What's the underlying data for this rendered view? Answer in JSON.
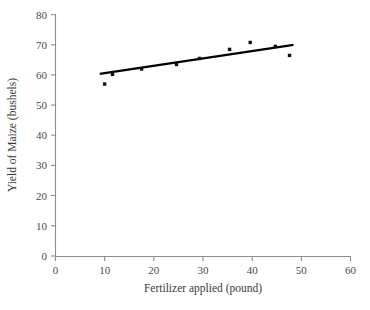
{
  "chart_data": {
    "type": "scatter",
    "title": "",
    "subtitle": "",
    "xlabel": "Fertilizer applied (pound)",
    "ylabel": "Yield of Maize (bushels)",
    "xlim": [
      0,
      60
    ],
    "ylim": [
      0,
      80
    ],
    "xticks": [
      0,
      10,
      20,
      30,
      40,
      50,
      60
    ],
    "yticks": [
      0,
      10,
      20,
      30,
      40,
      50,
      60,
      70,
      80
    ],
    "xtick_labels": [
      "0",
      "10",
      "20",
      "30",
      "40",
      "50",
      "60"
    ],
    "ytick_labels": [
      "0",
      "10",
      "20",
      "30",
      "40",
      "50",
      "60",
      "70",
      "80"
    ],
    "grid": false,
    "legend": null,
    "legend_position": "none",
    "marker": "square",
    "marker_color": "#111111",
    "series": [
      {
        "name": "Observed yield",
        "type": "scatter",
        "x": [
          10,
          11.6,
          17.5,
          24.6,
          29.3,
          35.4,
          39.6,
          44.7,
          47.6
        ],
        "y": [
          57.0,
          60.2,
          62.0,
          63.5,
          65.5,
          68.5,
          70.8,
          69.5,
          66.5
        ]
      },
      {
        "name": "Linear trend line",
        "type": "line",
        "color": "#000000",
        "x": [
          9.0,
          48.4
        ],
        "y": [
          60.4,
          70.0
        ]
      }
    ],
    "annotations": []
  },
  "axes": {
    "y_axis_name": "y-axis",
    "x_axis_name": "x-axis"
  }
}
